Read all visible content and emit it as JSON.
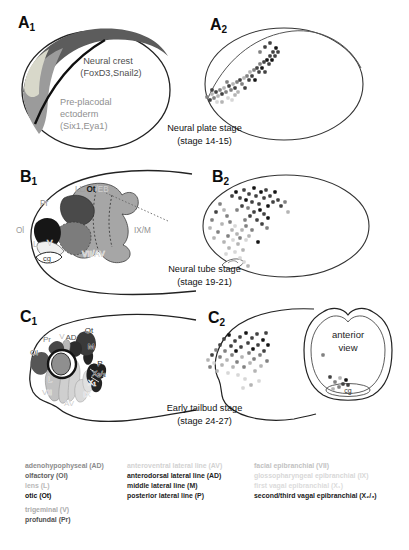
{
  "palette": {
    "k": "#141414",
    "d": "#424242",
    "m": "#818181",
    "l": "#b4b4b4",
    "v": "#d7d7d7"
  },
  "panel_labels": {
    "a1": {
      "letter": "A",
      "sub": "1"
    },
    "a2": {
      "letter": "A",
      "sub": "2"
    },
    "b1": {
      "letter": "B",
      "sub": "1"
    },
    "b2": {
      "letter": "B",
      "sub": "2"
    },
    "c1": {
      "letter": "C",
      "sub": "1"
    },
    "c2": {
      "letter": "C",
      "sub": "2"
    }
  },
  "captions": {
    "a": {
      "line1": "Neural plate stage",
      "line2": "(stage 14-15)"
    },
    "b": {
      "line1": "Neural tube stage",
      "line2": "(stage 19-21)"
    },
    "c": {
      "line1": "Early tailbud stage",
      "line2": "(stage 24-27)"
    }
  },
  "a1_labels": {
    "nc1": "Neural crest",
    "nc2": "(FoxD3,Snail2)",
    "ppe1": "Pre-placodal",
    "ppe2": "ectoderm",
    "ppe3": "(Six1,Eya1)"
  },
  "b1_labels": {
    "pr": "Pr",
    "ol": "Ol",
    "l": "L",
    "v": "V",
    "cg": "cg",
    "ll": "LL/",
    "ot": "Ot",
    "eb": "/EB",
    "ixm": "IX/M",
    "viiav": "VII/AV"
  },
  "c1_labels": {
    "ol": "Ol",
    "pr": "Pr",
    "v": "V",
    "ad": "AD",
    "ot": "Ot",
    "m": "M",
    "p": "P",
    "l": "L",
    "vii": "VII",
    "av": "AV",
    "ix": "IX",
    "x1": "X₁",
    "x23": "X₂/₃"
  },
  "c2_labels": {
    "anterior1": "anterior",
    "anterior2": "view",
    "cg": "cg"
  },
  "chart_data": {
    "type": "scatter",
    "note": "cell position dots per developmental stage panel; coords are local SVG px, third item is palette shade key",
    "a2": [
      [
        5,
        95,
        "m"
      ],
      [
        8,
        98,
        "d"
      ],
      [
        10,
        92,
        "l"
      ],
      [
        12,
        96,
        "m"
      ],
      [
        14,
        90,
        "d"
      ],
      [
        16,
        94,
        "l"
      ],
      [
        18,
        88,
        "m"
      ],
      [
        20,
        92,
        "d"
      ],
      [
        22,
        86,
        "l"
      ],
      [
        24,
        90,
        "m"
      ],
      [
        26,
        96,
        "v"
      ],
      [
        27,
        84,
        "d"
      ],
      [
        29,
        88,
        "m"
      ],
      [
        31,
        82,
        "l"
      ],
      [
        33,
        86,
        "d"
      ],
      [
        35,
        80,
        "m"
      ],
      [
        36,
        90,
        "l"
      ],
      [
        38,
        78,
        "d"
      ],
      [
        40,
        82,
        "m"
      ],
      [
        42,
        76,
        "l"
      ],
      [
        43,
        86,
        "d"
      ],
      [
        45,
        74,
        "m"
      ],
      [
        47,
        78,
        "d"
      ],
      [
        48,
        70,
        "l"
      ],
      [
        50,
        74,
        "d"
      ],
      [
        52,
        68,
        "m"
      ],
      [
        53,
        78,
        "k"
      ],
      [
        55,
        66,
        "d"
      ],
      [
        57,
        70,
        "d"
      ],
      [
        58,
        62,
        "m"
      ],
      [
        60,
        66,
        "k"
      ],
      [
        62,
        60,
        "d"
      ],
      [
        63,
        70,
        "d"
      ],
      [
        65,
        58,
        "k"
      ],
      [
        67,
        62,
        "d"
      ],
      [
        68,
        54,
        "d"
      ],
      [
        70,
        58,
        "k"
      ],
      [
        71,
        50,
        "d"
      ],
      [
        73,
        54,
        "d"
      ],
      [
        74,
        46,
        "k"
      ],
      [
        76,
        50,
        "d"
      ],
      [
        68,
        41,
        "d"
      ],
      [
        63,
        45,
        "d"
      ],
      [
        58,
        50,
        "m"
      ],
      [
        15,
        100,
        "v"
      ],
      [
        20,
        100,
        "l"
      ],
      [
        30,
        98,
        "v"
      ],
      [
        10,
        88,
        "d"
      ],
      [
        25,
        80,
        "m"
      ],
      [
        33,
        93,
        "l"
      ]
    ],
    "b2": [
      [
        30,
        34,
        "d"
      ],
      [
        34,
        30,
        "k"
      ],
      [
        38,
        36,
        "d"
      ],
      [
        42,
        28,
        "d"
      ],
      [
        44,
        38,
        "k"
      ],
      [
        47,
        32,
        "d"
      ],
      [
        50,
        40,
        "d"
      ],
      [
        52,
        26,
        "k"
      ],
      [
        54,
        34,
        "d"
      ],
      [
        57,
        42,
        "d"
      ],
      [
        59,
        30,
        "k"
      ],
      [
        62,
        36,
        "d"
      ],
      [
        64,
        28,
        "d"
      ],
      [
        66,
        44,
        "k"
      ],
      [
        68,
        34,
        "d"
      ],
      [
        71,
        40,
        "d"
      ],
      [
        73,
        30,
        "k"
      ],
      [
        76,
        38,
        "d"
      ],
      [
        79,
        44,
        "d"
      ],
      [
        58,
        48,
        "k"
      ],
      [
        52,
        50,
        "d"
      ],
      [
        46,
        46,
        "m"
      ],
      [
        40,
        44,
        "d"
      ],
      [
        35,
        48,
        "m"
      ],
      [
        62,
        52,
        "d"
      ],
      [
        66,
        56,
        "k"
      ],
      [
        48,
        54,
        "d"
      ],
      [
        43,
        58,
        "m"
      ],
      [
        55,
        58,
        "d"
      ],
      [
        60,
        62,
        "d"
      ],
      [
        65,
        66,
        "m"
      ],
      [
        83,
        40,
        "m"
      ],
      [
        86,
        50,
        "l"
      ],
      [
        18,
        42,
        "m"
      ],
      [
        14,
        50,
        "d"
      ],
      [
        10,
        58,
        "m"
      ],
      [
        8,
        66,
        "l"
      ],
      [
        22,
        48,
        "l"
      ],
      [
        25,
        54,
        "m"
      ],
      [
        20,
        62,
        "l"
      ],
      [
        16,
        70,
        "m"
      ],
      [
        12,
        76,
        "l"
      ],
      [
        28,
        60,
        "m"
      ],
      [
        30,
        68,
        "l"
      ],
      [
        26,
        74,
        "m"
      ],
      [
        22,
        80,
        "l"
      ],
      [
        33,
        64,
        "v"
      ],
      [
        35,
        72,
        "l"
      ],
      [
        31,
        78,
        "v"
      ],
      [
        27,
        86,
        "l"
      ],
      [
        24,
        92,
        "v"
      ],
      [
        36,
        82,
        "l"
      ],
      [
        33,
        90,
        "v"
      ],
      [
        38,
        76,
        "m"
      ],
      [
        40,
        68,
        "l"
      ],
      [
        44,
        64,
        "m"
      ],
      [
        41,
        88,
        "l"
      ],
      [
        38,
        96,
        "v"
      ],
      [
        56,
        80,
        "k"
      ],
      [
        47,
        74,
        "l"
      ],
      [
        50,
        68,
        "m"
      ],
      [
        44,
        78,
        "v"
      ],
      [
        42,
        100,
        "v"
      ],
      [
        46,
        104,
        "l"
      ]
    ],
    "c2": [
      [
        8,
        62,
        "m"
      ],
      [
        6,
        55,
        "l"
      ],
      [
        10,
        50,
        "d"
      ],
      [
        12,
        58,
        "v"
      ],
      [
        14,
        45,
        "m"
      ],
      [
        15,
        66,
        "l"
      ],
      [
        18,
        40,
        "d"
      ],
      [
        18,
        52,
        "m"
      ],
      [
        20,
        60,
        "l"
      ],
      [
        22,
        34,
        "d"
      ],
      [
        23,
        46,
        "m"
      ],
      [
        25,
        55,
        "l"
      ],
      [
        26,
        68,
        "v"
      ],
      [
        27,
        30,
        "k"
      ],
      [
        29,
        41,
        "d"
      ],
      [
        30,
        50,
        "m"
      ],
      [
        31,
        62,
        "l"
      ],
      [
        33,
        36,
        "d"
      ],
      [
        34,
        46,
        "k"
      ],
      [
        35,
        57,
        "m"
      ],
      [
        36,
        70,
        "v"
      ],
      [
        38,
        32,
        "d"
      ],
      [
        39,
        42,
        "d"
      ],
      [
        40,
        52,
        "l"
      ],
      [
        42,
        62,
        "m"
      ],
      [
        43,
        74,
        "v"
      ],
      [
        44,
        28,
        "k"
      ],
      [
        46,
        38,
        "d"
      ],
      [
        47,
        48,
        "m"
      ],
      [
        48,
        58,
        "l"
      ],
      [
        50,
        33,
        "d"
      ],
      [
        51,
        44,
        "k"
      ],
      [
        52,
        54,
        "m"
      ],
      [
        53,
        66,
        "l"
      ],
      [
        55,
        29,
        "d"
      ],
      [
        56,
        40,
        "d"
      ],
      [
        58,
        50,
        "m"
      ],
      [
        59,
        61,
        "l"
      ],
      [
        61,
        35,
        "k"
      ],
      [
        62,
        46,
        "d"
      ],
      [
        64,
        28,
        "d"
      ],
      [
        65,
        56,
        "m"
      ],
      [
        66,
        40,
        "k"
      ],
      [
        57,
        76,
        "v"
      ],
      [
        49,
        80,
        "l"
      ],
      [
        41,
        83,
        "v"
      ]
    ],
    "c2_inset": [
      [
        121,
        50,
        "m"
      ],
      [
        128,
        72,
        "d"
      ],
      [
        133,
        77,
        "m"
      ],
      [
        138,
        73,
        "l"
      ],
      [
        141,
        79,
        "d"
      ],
      [
        144,
        75,
        "k"
      ],
      [
        137,
        82,
        "m"
      ],
      [
        146,
        80,
        "d"
      ],
      [
        131,
        84,
        "l"
      ]
    ]
  },
  "legend": {
    "col1": [
      {
        "text": "adenohypophyseal (AD)",
        "color": "#8c8c8c"
      },
      {
        "text": "olfactory (Ol)",
        "color": "#5e5e5e"
      },
      {
        "text": "lens (L)",
        "color": "#b8b8b8"
      },
      {
        "text": "otic (Ot)",
        "color": "#101010"
      },
      {
        "text": "trigeminal (V)",
        "color": "#ababab",
        "gap": true
      },
      {
        "text": "profundal (Pr)",
        "color": "#4f4f4f"
      }
    ],
    "col2": [
      {
        "text": "anteroventral lateral line (AV)",
        "color": "#d2d2d2"
      },
      {
        "text": "anterodorsal lateral line (AD)",
        "color": "#1c1c1c"
      },
      {
        "text": "middle lateral line (M)",
        "color": "#262626"
      },
      {
        "text": "posterior lateral line (P)",
        "color": "#222222"
      }
    ],
    "col3": [
      {
        "text": "facial epibranchial (VII)",
        "color": "#c2c2c2"
      },
      {
        "text": "glossopharyngeal epibranchial (IX)",
        "color": "#d8d8d8"
      },
      {
        "text": "first vagal epibranchial (X₁)",
        "color": "#dcdcdc"
      },
      {
        "text": "second/third vagal epibranchial (X₂/₃)",
        "color": "#1a1a1a"
      }
    ]
  }
}
